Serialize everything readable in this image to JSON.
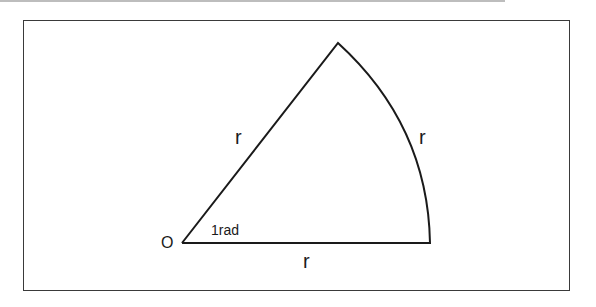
{
  "diagram": {
    "labels": {
      "origin": "O",
      "angle": "1rad",
      "radius_slanted": "r",
      "radius_base": "r",
      "arc_length": "r"
    },
    "geometry": {
      "origin": [
        182,
        243
      ],
      "base_end": [
        430,
        243
      ],
      "apex": [
        338,
        43
      ]
    },
    "colors": {
      "stroke": "#1a1a1a",
      "frame": "#3a3a3a",
      "background": "#ffffff"
    }
  }
}
